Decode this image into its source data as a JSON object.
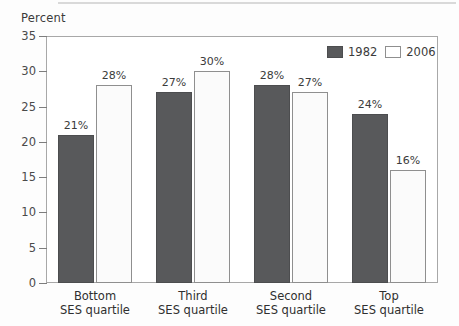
{
  "chart_data": {
    "type": "bar",
    "title": "",
    "ylabel": "Percent",
    "xlabel": "",
    "ylim": [
      0,
      35
    ],
    "yticks": [
      0,
      5,
      10,
      15,
      20,
      25,
      30,
      35
    ],
    "grid": false,
    "legend_position": "top-right",
    "categories": [
      "Bottom\nSES quartile",
      "Third\nSES quartile",
      "Second\nSES quartile",
      "Top\nSES quartile"
    ],
    "category_lines": [
      [
        "Bottom",
        "SES quartile"
      ],
      [
        "Third",
        "SES quartile"
      ],
      [
        "Second",
        "SES quartile"
      ],
      [
        "Top",
        "SES quartile"
      ]
    ],
    "series": [
      {
        "name": "1982",
        "color": "#58595b",
        "values": [
          21,
          27,
          28,
          24
        ],
        "labels": [
          "21%",
          "27%",
          "28%",
          "24%"
        ]
      },
      {
        "name": "2006",
        "color": "#ffffff",
        "values": [
          28,
          30,
          27,
          16
        ],
        "labels": [
          "28%",
          "30%",
          "27%",
          "16%"
        ]
      }
    ]
  },
  "axis": {
    "y_title": "Percent",
    "y_tick_labels": [
      "0",
      "5",
      "10",
      "15",
      "20",
      "25",
      "30",
      "35"
    ]
  },
  "legend": {
    "items": [
      {
        "label": "1982",
        "style": "dark"
      },
      {
        "label": "2006",
        "style": "light"
      }
    ]
  }
}
